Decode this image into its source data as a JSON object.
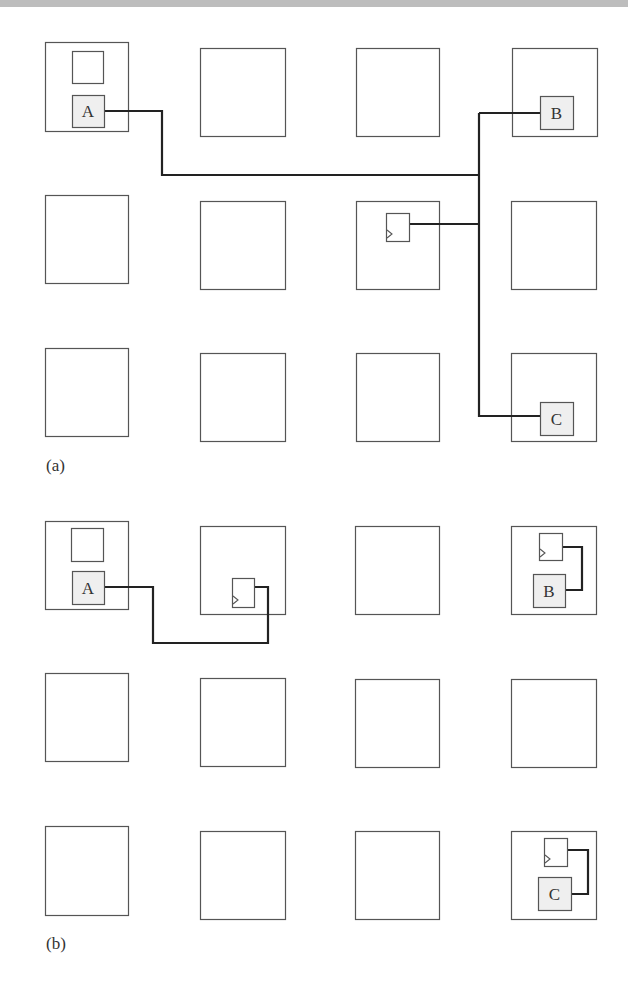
{
  "figure": {
    "panels": [
      {
        "id": "a",
        "caption": "(a)",
        "caption_pos": [
          46,
          470
        ],
        "tiles": [
          {
            "x": 45,
            "y": 42,
            "w": 83,
            "h": 89
          },
          {
            "x": 200,
            "y": 48,
            "w": 85,
            "h": 88
          },
          {
            "x": 356,
            "y": 48,
            "w": 83,
            "h": 88
          },
          {
            "x": 512,
            "y": 48,
            "w": 85,
            "h": 88
          },
          {
            "x": 45,
            "y": 195,
            "w": 83,
            "h": 88
          },
          {
            "x": 200,
            "y": 201,
            "w": 85,
            "h": 88
          },
          {
            "x": 356,
            "y": 201,
            "w": 83,
            "h": 88
          },
          {
            "x": 511,
            "y": 201,
            "w": 85,
            "h": 88
          },
          {
            "x": 45,
            "y": 348,
            "w": 83,
            "h": 88
          },
          {
            "x": 200,
            "y": 353,
            "w": 85,
            "h": 88
          },
          {
            "x": 356,
            "y": 353,
            "w": 83,
            "h": 88
          },
          {
            "x": 511,
            "y": 353,
            "w": 85,
            "h": 88
          }
        ],
        "cells": [
          {
            "label": "",
            "x": 72,
            "y": 51,
            "w": 31,
            "h": 32,
            "shaded": false
          },
          {
            "label": "A",
            "x": 72,
            "y": 95,
            "w": 32,
            "h": 32,
            "shaded": true
          },
          {
            "label": "B",
            "x": 540,
            "y": 96,
            "w": 33,
            "h": 33,
            "shaded": true
          },
          {
            "label": "C",
            "x": 540,
            "y": 402,
            "w": 33,
            "h": 33,
            "shaded": true
          }
        ],
        "flipflops": [
          {
            "x": 386,
            "y": 213,
            "w": 23,
            "h": 28
          }
        ],
        "wires": [
          "M104,111 H162 V175 H479",
          "M479,113 H540",
          "M479,113 V416 H540",
          "M409,224 H479"
        ]
      },
      {
        "id": "b",
        "caption": "(b)",
        "caption_pos": [
          46,
          948
        ],
        "tiles": [
          {
            "x": 45,
            "y": 521,
            "w": 83,
            "h": 88
          },
          {
            "x": 200,
            "y": 526,
            "w": 85,
            "h": 88
          },
          {
            "x": 355,
            "y": 526,
            "w": 84,
            "h": 88
          },
          {
            "x": 511,
            "y": 526,
            "w": 85,
            "h": 88
          },
          {
            "x": 37,
            "y": 673,
            "w": 70,
            "h": 88
          },
          {
            "x": 200,
            "y": 678,
            "w": 70,
            "h": 88
          },
          {
            "x": 355,
            "y": 679,
            "w": 70,
            "h": 88
          },
          {
            "x": 511,
            "y": 679,
            "w": 71,
            "h": 88
          },
          {
            "x": 45,
            "y": 826,
            "w": 83,
            "h": 89
          },
          {
            "x": 200,
            "y": 831,
            "w": 85,
            "h": 88
          },
          {
            "x": 355,
            "y": 831,
            "w": 84,
            "h": 88
          },
          {
            "x": 511,
            "y": 831,
            "w": 85,
            "h": 88
          }
        ],
        "cells": [
          {
            "label": "",
            "x": 71,
            "y": 528,
            "w": 32,
            "h": 33,
            "shaded": false
          },
          {
            "label": "A",
            "x": 72,
            "y": 571,
            "w": 32,
            "h": 33,
            "shaded": true
          },
          {
            "label": "B",
            "x": 533,
            "y": 574,
            "w": 32,
            "h": 33,
            "shaded": true
          },
          {
            "label": "C",
            "x": 538,
            "y": 877,
            "w": 33,
            "h": 33,
            "shaded": true
          }
        ],
        "flipflops": [
          {
            "x": 232,
            "y": 578,
            "w": 22,
            "h": 29
          },
          {
            "x": 539,
            "y": 533,
            "w": 23,
            "h": 27
          },
          {
            "x": 544,
            "y": 838,
            "w": 23,
            "h": 28
          }
        ],
        "wires": [
          "M104,587 H153 V643 H268 V587 H254",
          "M562,547 H582 V590 H565",
          "M567,850 H588 V894 H571"
        ]
      }
    ]
  }
}
